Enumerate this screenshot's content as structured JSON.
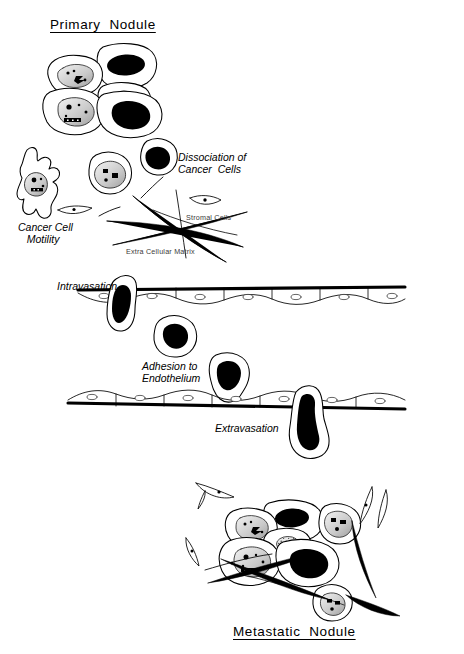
{
  "figure": {
    "title_top": "Primary  Nodule",
    "title_bottom": "Metastatic  Nodule",
    "background": "#ffffff",
    "ink": "#000000"
  },
  "labels": {
    "primary_nodule": "Primary  Nodule",
    "dissociation": "Dissociation of\nCancer  Cells",
    "motility": "Cancer Cell\n   Motility",
    "stromal_cells": "Stromal Cells",
    "ecm": "Extra Cellular Matrix",
    "intravasation": "Intravasation",
    "adhesion": "Adhesion to\nEndothelium",
    "extravasation": "Extravasation",
    "metastatic_nodule": "Metastatic  Nodule"
  },
  "stages": [
    {
      "id": "primary-nodule",
      "label": "Primary  Nodule",
      "order": 1
    },
    {
      "id": "dissociation",
      "label": "Dissociation of Cancer Cells",
      "order": 2
    },
    {
      "id": "motility",
      "label": "Cancer Cell Motility",
      "order": 3
    },
    {
      "id": "intravasation",
      "label": "Intravasation",
      "order": 4
    },
    {
      "id": "adhesion",
      "label": "Adhesion to Endothelium",
      "order": 5
    },
    {
      "id": "extravasation",
      "label": "Extravasation",
      "order": 6
    },
    {
      "id": "metastatic-nodule",
      "label": "Metastatic  Nodule",
      "order": 7
    }
  ],
  "annotations": {
    "stromal_cells": "Stromal Cells",
    "extracellular_matrix": "Extra Cellular Matrix"
  }
}
